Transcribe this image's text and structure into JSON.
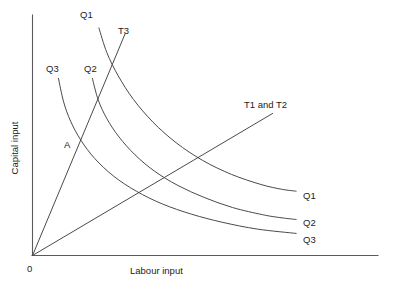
{
  "figure": {
    "background_color": "#ffffff",
    "line_color": "#4a4a4a",
    "axis_color": "#5a5a5a",
    "text_color": "#1c1c1c"
  },
  "axes": {
    "x_label": "Labour input",
    "y_label": "Capital input",
    "origin_label": "0"
  },
  "labels": {
    "q1_top": "Q1",
    "q2_top": "Q2",
    "q3_top": "Q3",
    "t3_top": "T3",
    "t1t2": "T1 and T2",
    "q1_right": "Q1",
    "q2_right": "Q2",
    "q3_right": "Q3",
    "point_a": "A"
  },
  "chart_data": {
    "type": "line",
    "xlabel": "Labour input",
    "ylabel": "Capital input",
    "xlim": [
      0,
      1
    ],
    "ylim": [
      0,
      1
    ],
    "grid": false,
    "legend": "inline-end-labels",
    "annotations": [
      {
        "text": "A",
        "x": 0.12,
        "y": 0.46,
        "note": "intersection of ray T3 with isoquant Q3"
      },
      {
        "text": "0",
        "x": 0.0,
        "y": 0.0,
        "note": "origin"
      }
    ],
    "series": [
      {
        "name": "Q3",
        "kind": "isoquant",
        "label_top": "Q3",
        "label_right": "Q3",
        "points": [
          [
            0.075,
            0.738
          ],
          [
            0.09,
            0.64
          ],
          [
            0.11,
            0.56
          ],
          [
            0.14,
            0.48
          ],
          [
            0.18,
            0.404
          ],
          [
            0.235,
            0.33
          ],
          [
            0.3,
            0.268
          ],
          [
            0.375,
            0.215
          ],
          [
            0.46,
            0.172
          ],
          [
            0.55,
            0.138
          ],
          [
            0.65,
            0.11
          ],
          [
            0.762,
            0.092
          ]
        ]
      },
      {
        "name": "Q2",
        "kind": "isoquant",
        "label_top": "Q2",
        "label_right": "Q2",
        "points": [
          [
            0.173,
            0.738
          ],
          [
            0.19,
            0.648
          ],
          [
            0.215,
            0.57
          ],
          [
            0.25,
            0.494
          ],
          [
            0.296,
            0.42
          ],
          [
            0.352,
            0.352
          ],
          [
            0.42,
            0.292
          ],
          [
            0.496,
            0.242
          ],
          [
            0.578,
            0.2
          ],
          [
            0.665,
            0.17
          ],
          [
            0.715,
            0.158
          ],
          [
            0.762,
            0.15
          ]
        ]
      },
      {
        "name": "Q1",
        "kind": "isoquant",
        "label_top": "Q1",
        "label_right": "Q1",
        "points": [
          [
            0.192,
            0.948
          ],
          [
            0.215,
            0.845
          ],
          [
            0.248,
            0.748
          ],
          [
            0.292,
            0.65
          ],
          [
            0.348,
            0.556
          ],
          [
            0.415,
            0.47
          ],
          [
            0.492,
            0.396
          ],
          [
            0.575,
            0.338
          ],
          [
            0.66,
            0.296
          ],
          [
            0.72,
            0.276
          ],
          [
            0.762,
            0.268
          ]
        ]
      },
      {
        "name": "T3",
        "kind": "ray",
        "label_top": "T3",
        "points": [
          [
            0.0,
            0.0
          ],
          [
            0.268,
            0.925
          ]
        ]
      },
      {
        "name": "T1 and T2",
        "kind": "ray",
        "label_top": "T1 and T2",
        "points": [
          [
            0.0,
            0.0
          ],
          [
            0.694,
            0.592
          ]
        ]
      }
    ]
  }
}
